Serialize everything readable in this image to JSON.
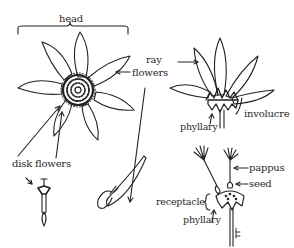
{
  "diagram": {
    "labels": {
      "head": "head",
      "ray": "ray",
      "flowers": "flowers",
      "involucre": "involucre",
      "phyllary_top": "phyllary",
      "disk_flowers": "disk flowers",
      "pappus": "pappus",
      "seed": "seed",
      "receptacle": "receptacle",
      "phyllary_bottom": "phyllary"
    },
    "figures": [
      {
        "name": "flower-head-top-view",
        "description": "Flower head viewed from above with ray petals and central disk"
      },
      {
        "name": "flower-head-side-view",
        "description": "Flower head side view showing involucre and phyllaries"
      },
      {
        "name": "disk-flower",
        "description": "Single disk flower"
      },
      {
        "name": "ray-flower",
        "description": "Single ray flower"
      },
      {
        "name": "seed-head",
        "description": "Receptacle with seeds and pappus"
      }
    ],
    "colors": {
      "ink": "#222222",
      "background": "#ffffff"
    }
  }
}
